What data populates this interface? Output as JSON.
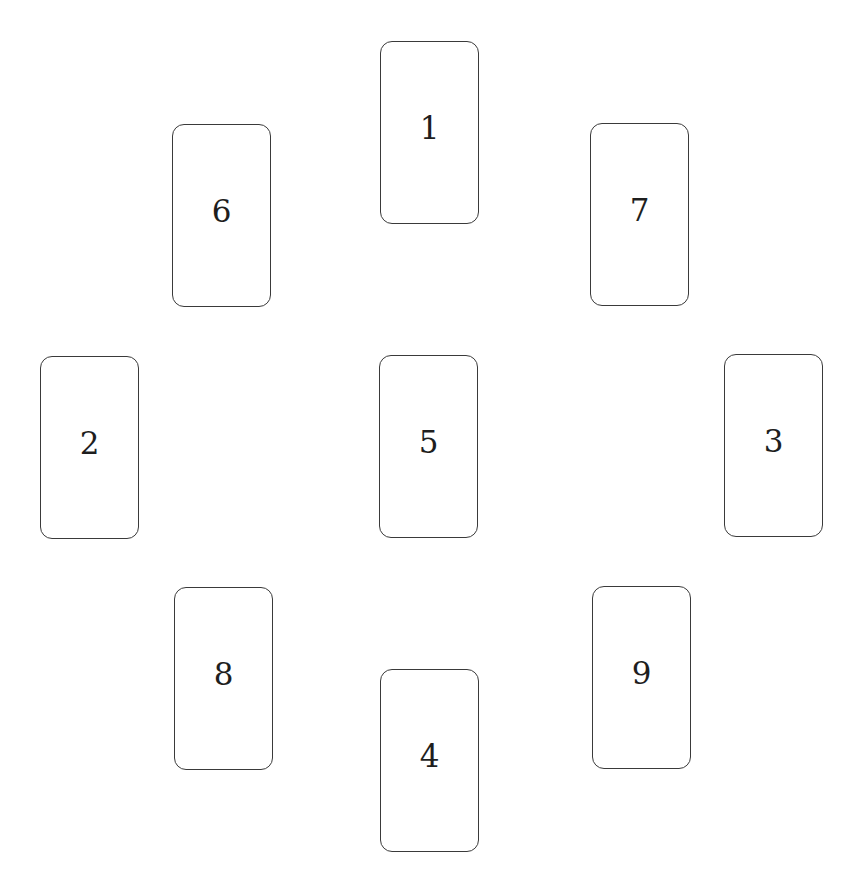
{
  "spread": {
    "description": "Nine-card spread layout",
    "cards": [
      {
        "position": "1",
        "label": "1"
      },
      {
        "position": "2",
        "label": "2"
      },
      {
        "position": "3",
        "label": "3"
      },
      {
        "position": "4",
        "label": "4"
      },
      {
        "position": "5",
        "label": "5"
      },
      {
        "position": "6",
        "label": "6"
      },
      {
        "position": "7",
        "label": "7"
      },
      {
        "position": "8",
        "label": "8"
      },
      {
        "position": "9",
        "label": "9"
      }
    ]
  },
  "colors": {
    "background": "#ffffff",
    "card_border": "#3a3a3a",
    "text": "#1e1e1e"
  }
}
